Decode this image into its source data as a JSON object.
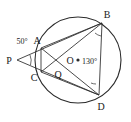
{
  "figure": {
    "stroke_color": "#2b2b2b",
    "label_color": "#1a1a1a",
    "background": "#ffffff",
    "circle": {
      "cx": 78,
      "cy": 60,
      "r": 43,
      "center_label": "O"
    },
    "points": [
      {
        "id": "A",
        "label": "A",
        "x": 41,
        "y": 48,
        "label_x": 37,
        "label_y": 44,
        "on_circle": true
      },
      {
        "id": "B",
        "label": "B",
        "x": 102,
        "y": 23,
        "label_x": 107,
        "label_y": 18,
        "on_circle": true
      },
      {
        "id": "C",
        "label": "C",
        "x": 41,
        "y": 72,
        "label_x": 34,
        "label_y": 81,
        "on_circle": true
      },
      {
        "id": "D",
        "label": "D",
        "x": 99,
        "y": 95,
        "label_x": 101,
        "label_y": 110,
        "on_circle": true
      },
      {
        "id": "P",
        "label": "P",
        "x": 17,
        "y": 60,
        "label_x": 9,
        "label_y": 64,
        "on_circle": false
      },
      {
        "id": "Q",
        "label": "Q",
        "x": 58,
        "y": 68,
        "label_x": 58,
        "label_y": 78,
        "on_circle": false
      },
      {
        "id": "O",
        "label": "O",
        "x": 78,
        "y": 60,
        "label_x": 70,
        "label_y": 64,
        "on_circle": false
      }
    ],
    "segments": [
      {
        "from": "P",
        "to": "B",
        "name": "segment-pb"
      },
      {
        "from": "P",
        "to": "D",
        "name": "segment-pd"
      },
      {
        "from": "A",
        "to": "B",
        "name": "segment-ab"
      },
      {
        "from": "A",
        "to": "D",
        "name": "segment-ad"
      },
      {
        "from": "B",
        "to": "C",
        "name": "segment-bc"
      },
      {
        "from": "B",
        "to": "D",
        "name": "segment-bd"
      },
      {
        "from": "C",
        "to": "D",
        "name": "segment-cd"
      },
      {
        "from": "A",
        "to": "C",
        "name": "segment-ac"
      }
    ],
    "angles": [
      {
        "id": "angle-p",
        "value": "50°",
        "label_x": 22,
        "label_y": 44,
        "vertex": "P"
      },
      {
        "id": "angle-o",
        "value": "130°",
        "label_x": 82,
        "label_y": 64,
        "vertex": "O"
      },
      {
        "id": "angle-b",
        "value": "",
        "vertex": "B"
      },
      {
        "id": "angle-d",
        "value": "",
        "vertex": "D"
      }
    ],
    "center_dot": {
      "x": 78,
      "y": 60,
      "r": 1.6
    }
  }
}
